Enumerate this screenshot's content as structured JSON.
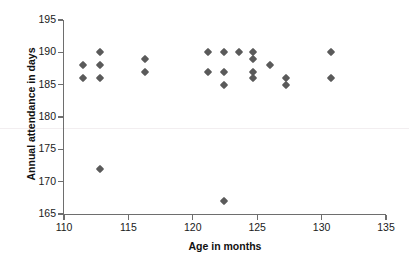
{
  "chart_data": {
    "type": "scatter",
    "title": "",
    "xlabel": "Age in months",
    "ylabel": "Annual attendance in days",
    "xlim": [
      110,
      135
    ],
    "ylim": [
      165,
      195
    ],
    "xticks": [
      110,
      115,
      120,
      125,
      130,
      135
    ],
    "yticks": [
      165,
      170,
      175,
      180,
      185,
      190,
      195
    ],
    "grid": false,
    "legend": null,
    "marker": "diamond",
    "marker_color": "#5a5a5a",
    "points": [
      {
        "x": 111.5,
        "y": 188
      },
      {
        "x": 111.5,
        "y": 186
      },
      {
        "x": 112.8,
        "y": 190
      },
      {
        "x": 112.8,
        "y": 188
      },
      {
        "x": 112.8,
        "y": 186
      },
      {
        "x": 112.8,
        "y": 172
      },
      {
        "x": 116.3,
        "y": 189
      },
      {
        "x": 116.3,
        "y": 187
      },
      {
        "x": 121.2,
        "y": 190
      },
      {
        "x": 121.2,
        "y": 187
      },
      {
        "x": 122.4,
        "y": 190
      },
      {
        "x": 122.4,
        "y": 187
      },
      {
        "x": 122.4,
        "y": 185
      },
      {
        "x": 122.4,
        "y": 167
      },
      {
        "x": 123.6,
        "y": 190
      },
      {
        "x": 124.7,
        "y": 190
      },
      {
        "x": 124.7,
        "y": 189
      },
      {
        "x": 124.7,
        "y": 187
      },
      {
        "x": 124.7,
        "y": 186
      },
      {
        "x": 126.0,
        "y": 188
      },
      {
        "x": 127.2,
        "y": 186
      },
      {
        "x": 127.2,
        "y": 185
      },
      {
        "x": 130.7,
        "y": 190
      },
      {
        "x": 130.7,
        "y": 186
      }
    ]
  }
}
